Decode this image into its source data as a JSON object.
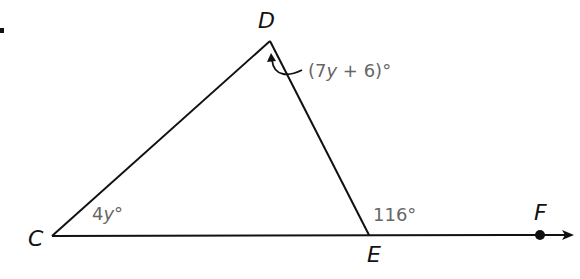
{
  "diagram": {
    "type": "triangle-exterior-angle",
    "vertices": {
      "C": {
        "label": "C",
        "x": 52,
        "y": 236
      },
      "D": {
        "label": "D",
        "x": 270,
        "y": 41
      },
      "E": {
        "label": "E",
        "x": 369,
        "y": 235
      },
      "F": {
        "label": "F",
        "x": 540,
        "y": 235
      }
    },
    "angles": {
      "C": {
        "coef": "4",
        "var": "y",
        "deg": "°"
      },
      "D": {
        "open": "(7",
        "var": "y",
        "rest": " + 6)°"
      },
      "E_exterior": {
        "text": "116°"
      }
    },
    "ray": {
      "from": "E",
      "through": "F",
      "arrow": true
    },
    "colors": {
      "line": "#111111",
      "angle_text": "#666666"
    }
  }
}
